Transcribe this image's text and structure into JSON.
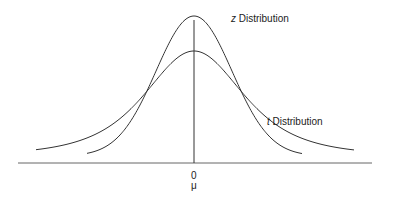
{
  "diagram": {
    "title": "",
    "curves": [
      {
        "name": "z Distribution",
        "italic_prefix": "z",
        "suffix": " Distribution",
        "peak_y": 16,
        "sigma_px": 38,
        "extent": [
          87,
          302
        ]
      },
      {
        "name": "t Distribution",
        "italic_prefix": "t",
        "suffix": " Distribution",
        "peak_y": 51,
        "sigma_px": 52,
        "extent": [
          36,
          354
        ]
      }
    ],
    "axis": {
      "tick_label": "0",
      "mean_label": "μ"
    },
    "colors": {
      "line": "#333333",
      "axis": "#555555"
    }
  }
}
